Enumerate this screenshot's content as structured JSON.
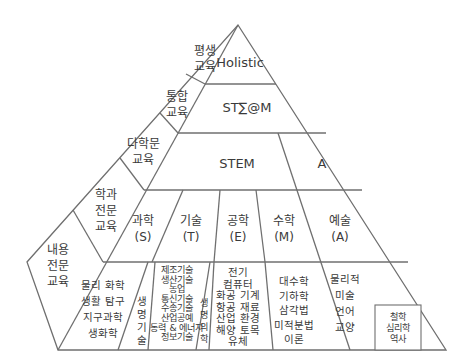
{
  "levels": {
    "holistic": "Holistic",
    "stsm": "ST∑@M",
    "stem": "STEM",
    "a": "A"
  },
  "side_labels": [
    {
      "lines": [
        "평생",
        "교육"
      ]
    },
    {
      "lines": [
        "통합",
        "교육"
      ]
    },
    {
      "lines": [
        "다학문",
        "교육"
      ]
    },
    {
      "lines": [
        "학과",
        "전문",
        "교육"
      ]
    },
    {
      "lines": [
        "내용",
        "전문",
        "교육"
      ]
    }
  ],
  "subjects": [
    {
      "name": "과학",
      "abbr": "(S)"
    },
    {
      "name": "기술",
      "abbr": "(T)"
    },
    {
      "name": "공학",
      "abbr": "(E)"
    },
    {
      "name": "수학",
      "abbr": "(M)"
    },
    {
      "name": "예술",
      "abbr": "(A)"
    }
  ],
  "contents": {
    "science": [
      "물리 화학",
      "생활 탐구",
      "지구과학",
      "생화학"
    ],
    "bio_tech": [
      "생",
      "명",
      "기",
      "술"
    ],
    "technology": [
      "제조기술",
      "생산기술",
      "농업",
      "통신기술",
      "수송기술",
      "산업공예",
      "동력 & 에너지",
      "정보기술"
    ],
    "bio_medicine": [
      "생",
      "명",
      "의",
      "학"
    ],
    "engineering": [
      "전기",
      "컴퓨터",
      "화공 기계",
      "항공 재료",
      "산업 환경",
      "해양 토목",
      "유체"
    ],
    "math": [
      "대수학",
      "기하학",
      "삼각법",
      "미적분법",
      "이론"
    ],
    "arts": [
      "물리적",
      "미술",
      "언어",
      "교양"
    ],
    "arts_box": [
      "철학",
      "심리학",
      "역사"
    ]
  }
}
